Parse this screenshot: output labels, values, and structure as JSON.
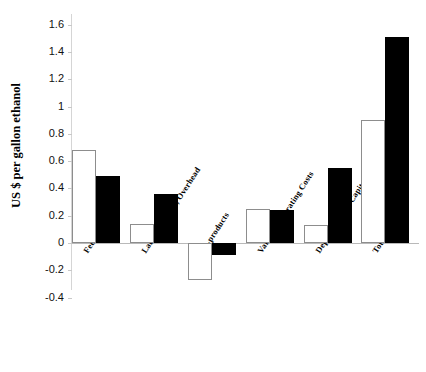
{
  "chart_data": {
    "type": "bar",
    "title": "",
    "xlabel": "",
    "ylabel": "US $ per gallon ethanol",
    "ylim": [
      -0.4,
      1.6
    ],
    "yticks": [
      -0.4,
      -0.2,
      0,
      0.2,
      0.4,
      0.6,
      0.8,
      1,
      1.2,
      1.4,
      1.6
    ],
    "ytick_labels": [
      "-0.4",
      "-0.2",
      "0",
      "0.2",
      "0.4",
      "0.6",
      "0.8",
      "1",
      "1.2",
      "1.4",
      "1.6"
    ],
    "grid": false,
    "legend": "none",
    "categories": [
      "Feedstock",
      "Labor, Supplies, Overhead",
      "Co-products",
      "Variable Operating Costs",
      "Depreciation of Capital",
      "Total"
    ],
    "series": [
      {
        "name": "white",
        "fill": "#ffffff",
        "stroke": "#8d8d8d",
        "values": [
          0.68,
          0.14,
          -0.27,
          0.25,
          0.13,
          0.9
        ]
      },
      {
        "name": "black",
        "fill": "#000000",
        "stroke": "#000000",
        "values": [
          0.49,
          0.36,
          -0.09,
          0.24,
          0.55,
          1.51
        ]
      }
    ]
  },
  "axis": {
    "y_title": "US $ per gallon ethanol"
  }
}
